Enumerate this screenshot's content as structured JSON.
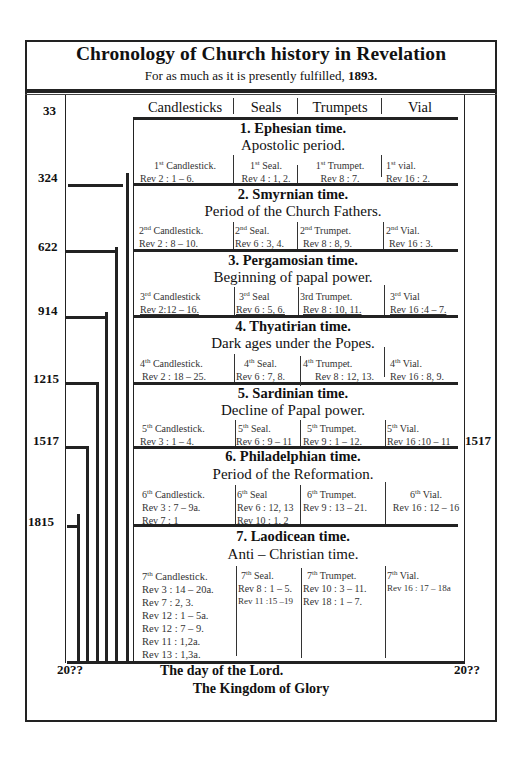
{
  "header": {
    "title": "Chronology of Church history in Revelation",
    "subtitle_prefix": "For as much as it is presently fulfilled, ",
    "subtitle_year": "1893."
  },
  "columns": [
    "Candlesticks",
    "Seals",
    "Trumpets",
    "Vial"
  ],
  "years_left": [
    "33",
    "324",
    "622",
    "914",
    "1215",
    "1517",
    "1815"
  ],
  "year_right": "1517",
  "end_left": "20??",
  "end_right": "20??",
  "periods": [
    {
      "title": "1. Ephesian time.",
      "subtitle": "Apostolic period.",
      "candlestick": {
        "num": "1",
        "sup": "st",
        "label": " Candlestick.",
        "refs": [
          "Rev 2 : 1 – 6."
        ]
      },
      "seal": {
        "num": "1",
        "sup": "st",
        "label": "  Seal.",
        "refs": [
          "Rev 4 : 1, 2."
        ]
      },
      "trumpet": {
        "num": "1",
        "sup": "st",
        "label": " Trumpet.",
        "refs": [
          "Rev 8 : 7."
        ]
      },
      "vial": {
        "num": "1",
        "sup": "st",
        "label": " vial.",
        "refs": [
          "Rev 16 : 2."
        ]
      }
    },
    {
      "title": "2. Smyrnian time.",
      "subtitle": "Period of  the Church Fathers.",
      "candlestick": {
        "num": "2",
        "sup": "nd",
        "label": " Candlestick.",
        "refs": [
          "Rev 2 : 8 – 10."
        ]
      },
      "seal": {
        "num": "2",
        "sup": "nd",
        "label": "  Seal.",
        "refs": [
          "Rev 6 : 3, 4."
        ]
      },
      "trumpet": {
        "num": "2",
        "sup": "nd",
        "label": " Trumpet.",
        "refs": [
          "Rev 8 : 8, 9."
        ]
      },
      "vial": {
        "num": "2",
        "sup": "nd",
        "label": " Vial.",
        "refs": [
          "Rev 16 : 3."
        ]
      }
    },
    {
      "title": "3. Pergamosian time.",
      "subtitle": "Beginning of papal power.",
      "candlestick": {
        "num": "3",
        "sup": "rd",
        "label": " Candlestick",
        "refs": [
          "Rev 2:12 – 16."
        ]
      },
      "seal": {
        "num": "3",
        "sup": "rd",
        "label": "  Seal",
        "refs": [
          "Rev 6 : 5, 6."
        ]
      },
      "trumpet": {
        "num": "3rd",
        "sup": "",
        "label": " Trumpet.",
        "refs": [
          "Rev 8 : 10, 11."
        ]
      },
      "vial": {
        "num": "3",
        "sup": "rd",
        "label": " Vial",
        "refs": [
          "Rev 16 :4 – 7."
        ]
      }
    },
    {
      "title": "4. Thyatirian time.",
      "subtitle": "Dark ages under the Popes.",
      "candlestick": {
        "num": "4",
        "sup": "th",
        "label": "  Candlestick.",
        "refs": [
          "Rev 2 : 18 – 25."
        ]
      },
      "seal": {
        "num": "4",
        "sup": "th",
        "label": "  Seal.",
        "refs": [
          "Rev 6 : 7, 8."
        ]
      },
      "trumpet": {
        "num": "4",
        "sup": "th",
        "label": "  Trumpet.",
        "refs": [
          "Rev 8 : 12, 13."
        ]
      },
      "vial": {
        "num": "4",
        "sup": "th",
        "label": "  Vial.",
        "refs": [
          "Rev 16 : 8, 9."
        ]
      }
    },
    {
      "title": "5. Sardinian time.",
      "subtitle": "Decline of  Papal power.",
      "candlestick": {
        "num": "5",
        "sup": "th",
        "label": "  Candlestick.",
        "refs": [
          "Rev 3 : 1 – 4."
        ]
      },
      "seal": {
        "num": "5",
        "sup": "th",
        "label": "  Seal.",
        "refs": [
          "Rev 6 : 9 – 11"
        ]
      },
      "trumpet": {
        "num": "5",
        "sup": "th",
        "label": "  Trumpet.",
        "refs": [
          "Rev 9 : 1 – 12."
        ]
      },
      "vial": {
        "num": "5",
        "sup": "th",
        "label": "  Vial.",
        "refs": [
          "Rev 16 :10 – 11"
        ]
      }
    },
    {
      "title": "6. Philadelphian time.",
      "subtitle": "Period of the Reformation.",
      "candlestick": {
        "num": "6",
        "sup": "th",
        "label": "  Candlestick.",
        "refs": [
          "Rev 3 : 7 – 9a.",
          "Rev 7 : 1"
        ]
      },
      "seal": {
        "num": "6",
        "sup": "th",
        "label": "  Seal",
        "refs": [
          "Rev 6 : 12, 13",
          "Rev 10 : 1, 2"
        ]
      },
      "trumpet": {
        "num": "6",
        "sup": "th",
        "label": "  Trumpet.",
        "refs": [
          "Rev 9 : 13 – 21."
        ]
      },
      "vial": {
        "num": "6",
        "sup": "th",
        "label": "  Vial.",
        "refs": [
          "Rev 16 : 12 – 16"
        ]
      }
    },
    {
      "title": "7. Laodicean time.",
      "subtitle": "Anti – Christian time.",
      "candlestick": {
        "num": "7",
        "sup": "th",
        "label": "  Candlestick.",
        "refs": [
          "Rev 3 : 14 – 20a.",
          "Rev 7 : 2, 3.",
          "Rev 12 : 1 – 5a.",
          "Rev 12 : 7 – 9.",
          "Rev 11 : 1,2a.",
          "Rev 13 : 1,3a."
        ]
      },
      "seal": {
        "num": "7",
        "sup": "th",
        "label": "  Seal.",
        "refs": [
          "Rev 8 : 1 – 5.",
          "Rev 11 :15 –19"
        ]
      },
      "trumpet": {
        "num": "7",
        "sup": "th",
        "label": "  Trumpet.",
        "refs": [
          "Rev 10 : 3 – 11.",
          "Rev 18 : 1 – 7."
        ]
      },
      "vial": {
        "num": "7",
        "sup": "th",
        "label": "  Vial.",
        "refs": [
          "Rev 16 : 17 – 18a"
        ]
      }
    }
  ],
  "footer": {
    "day_of_lord": "The day of the Lord.",
    "kingdom": "The Kingdom of Glory"
  }
}
